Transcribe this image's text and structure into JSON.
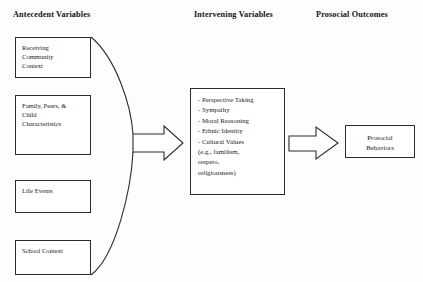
{
  "diagram": {
    "type": "flow",
    "columns": [
      {
        "id": "antecedent",
        "title": "Antecedent Variables"
      },
      {
        "id": "intervening",
        "title": "Intervening Variables"
      },
      {
        "id": "prosocial",
        "title": "Prosocial Outcomes"
      }
    ],
    "antecedent_nodes": [
      {
        "id": "receiving",
        "label": "Receiving\nCommunity\nContext"
      },
      {
        "id": "family",
        "label": "Family, Peers, &\nChild\nCharacteristics"
      },
      {
        "id": "life",
        "label": "Life Events"
      },
      {
        "id": "school",
        "label": "School Context"
      }
    ],
    "intervening_node": {
      "id": "intervening-list",
      "label": "- Perspective Taking\n- Sympathy\n- Moral Reasoning\n- Ethnic Identity\n- Cultural Values\n  (e.g., familism,\n  respeto,\n  religiousness)",
      "items": [
        "Perspective Taking",
        "Sympathy",
        "Moral Reasoning",
        "Ethnic Identity",
        "Cultural Values (e.g., familism, respeto, religiousness)"
      ]
    },
    "outcome_node": {
      "id": "prosocial-behaviors",
      "label": "Prosocial\nBehaviors"
    },
    "connectors": [
      {
        "id": "brace",
        "kind": "curly-brace",
        "from": [
          "receiving",
          "family",
          "life",
          "school"
        ],
        "to": "arrow-left"
      },
      {
        "id": "arrow-left",
        "kind": "block-arrow",
        "from": "antecedent-group",
        "to": "intervening-list"
      },
      {
        "id": "arrow-right",
        "kind": "block-arrow",
        "from": "intervening-list",
        "to": "prosocial-behaviors"
      }
    ],
    "colors": {
      "stroke": "#2b2b2b",
      "text": "#1a1a1a",
      "background": "#fdfdfd"
    }
  }
}
